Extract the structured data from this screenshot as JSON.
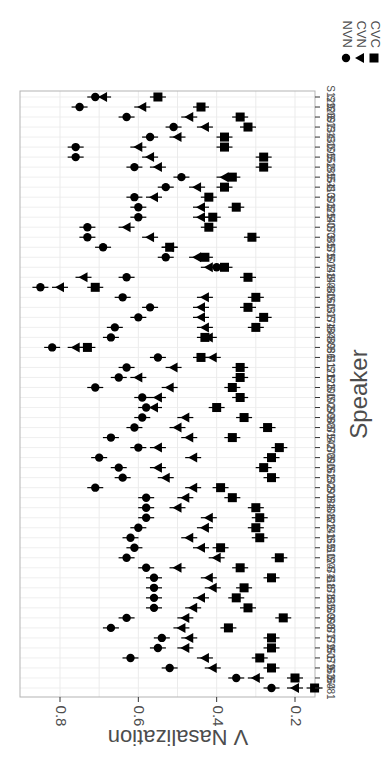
{
  "chart_data": {
    "type": "scatter",
    "orientation": "rotated-90-cw",
    "title": "",
    "xlabel": "Speaker",
    "ylabel": "V Nasalization",
    "ylim": [
      0.12,
      0.86
    ],
    "yticks": [
      0.2,
      0.4,
      0.6,
      0.8
    ],
    "ytick_labels": [
      "0.2",
      "0.4",
      "0.6",
      "0.8"
    ],
    "grid": true,
    "legend_position": "right-top",
    "error_bars": true,
    "categories": [
      "S081",
      "S164",
      "S163",
      "S079",
      "S151",
      "S179",
      "S077",
      "S098",
      "S109",
      "S135",
      "S178",
      "S118",
      "S074",
      "S124",
      "S110",
      "S165",
      "S141",
      "S122",
      "S108",
      "S084",
      "S091",
      "S132",
      "S162",
      "S090",
      "S078",
      "S142",
      "S075",
      "S088",
      "S099",
      "S102",
      "S100",
      "S123",
      "S121",
      "S111",
      "S086",
      "S089",
      "S184",
      "S174",
      "S137",
      "S160",
      "S080",
      "S144",
      "S148",
      "S107",
      "S175",
      "S085",
      "S073",
      "S140",
      "S125",
      "S093",
      "S113",
      "S154",
      "S185",
      "S152",
      "S105",
      "S130",
      "S134",
      "S097",
      "S126",
      "S129"
    ],
    "series": [
      {
        "name": "NVN",
        "marker": "circle",
        "values": [
          0.26,
          0.35,
          0.52,
          0.62,
          0.55,
          0.54,
          0.67,
          0.63,
          0.56,
          0.56,
          0.56,
          0.56,
          0.58,
          0.63,
          0.61,
          0.62,
          0.6,
          0.58,
          0.58,
          0.58,
          0.71,
          0.64,
          0.65,
          0.7,
          0.6,
          0.67,
          0.61,
          0.59,
          0.58,
          0.59,
          0.71,
          0.65,
          0.63,
          0.55,
          0.82,
          0.67,
          0.66,
          0.6,
          0.57,
          0.64,
          0.85,
          0.63,
          0.4,
          0.53,
          0.69,
          0.73,
          0.73,
          0.6,
          0.6,
          0.61,
          0.53,
          0.49,
          0.61,
          0.76,
          0.76,
          0.57,
          0.51,
          0.63,
          0.75,
          0.71
        ]
      },
      {
        "name": "CVN",
        "marker": "triangle",
        "values": [
          0.2,
          0.3,
          0.41,
          0.43,
          0.48,
          0.47,
          0.49,
          0.48,
          0.46,
          0.44,
          0.41,
          0.42,
          0.5,
          0.4,
          0.44,
          0.47,
          0.43,
          0.42,
          0.5,
          0.48,
          0.46,
          0.53,
          0.55,
          0.46,
          0.55,
          0.47,
          0.5,
          0.48,
          0.56,
          0.55,
          0.52,
          0.6,
          0.51,
          0.41,
          0.76,
          0.42,
          0.43,
          0.44,
          0.44,
          0.43,
          0.8,
          0.74,
          0.42,
          0.45,
          0.52,
          0.57,
          0.63,
          0.44,
          0.44,
          0.56,
          0.45,
          0.38,
          0.55,
          0.57,
          0.6,
          0.5,
          0.43,
          0.47,
          0.59,
          0.69
        ]
      },
      {
        "name": "CVC",
        "marker": "square",
        "values": [
          0.15,
          0.2,
          0.26,
          0.29,
          0.26,
          0.26,
          0.37,
          0.23,
          0.32,
          0.35,
          0.33,
          0.26,
          0.34,
          0.24,
          0.39,
          0.29,
          0.3,
          0.29,
          0.3,
          0.36,
          0.39,
          0.26,
          0.28,
          0.26,
          0.24,
          0.36,
          0.27,
          0.33,
          0.4,
          0.34,
          0.36,
          0.34,
          0.34,
          0.44,
          0.73,
          0.43,
          0.3,
          0.28,
          0.32,
          0.3,
          0.71,
          0.32,
          0.38,
          0.43,
          0.52,
          0.31,
          0.42,
          0.41,
          0.35,
          0.42,
          0.38,
          0.36,
          0.28,
          0.28,
          0.38,
          0.38,
          0.32,
          0.34,
          0.44,
          0.55
        ]
      }
    ]
  },
  "labels": {
    "y_axis_title": "V Nasalization",
    "x_axis_title": "Speaker",
    "legend": [
      {
        "label": "NVN",
        "marker": "circle"
      },
      {
        "label": "CVN",
        "marker": "triangle"
      },
      {
        "label": "CVC",
        "marker": "square"
      }
    ]
  },
  "colors": {
    "marker": "#000000",
    "frame": "#b3b3b3",
    "grid": "#ebebeb",
    "tick_text": "#4d4d4d",
    "title_text": "#000000"
  }
}
